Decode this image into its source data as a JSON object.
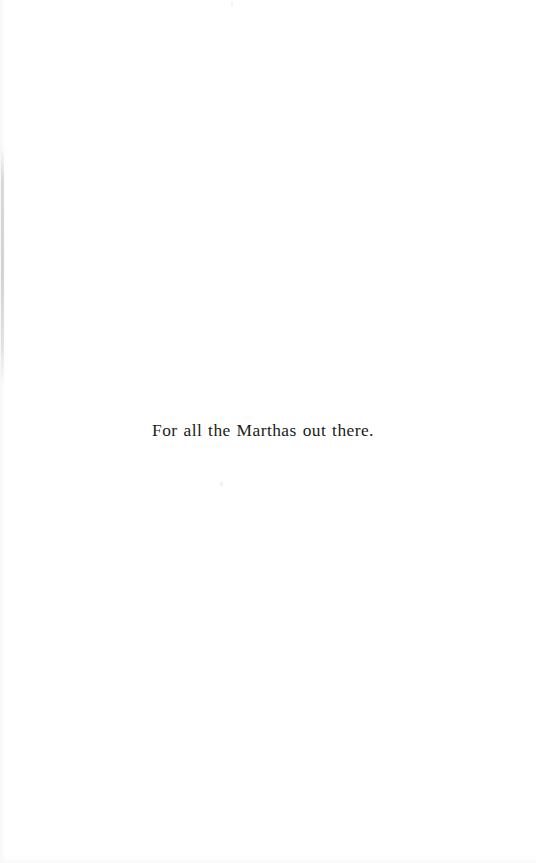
{
  "document": {
    "type": "book-dedication-page",
    "page_background_color": "#ffffff",
    "ink_color": "#1b1b21"
  },
  "dedication": {
    "text": "For all the Marthas out there."
  },
  "artifacts": {
    "left_gutter_edge": "scan-gutter-shadow",
    "speck_below_text": "scan-speck",
    "speck_top_margin": "scan-speck"
  }
}
